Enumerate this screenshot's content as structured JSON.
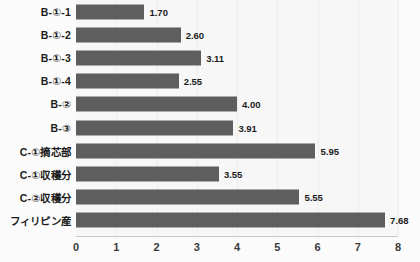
{
  "chart_data": {
    "type": "bar",
    "orientation": "horizontal",
    "title": "",
    "xlabel": "",
    "ylabel": "",
    "xlim": [
      0,
      8
    ],
    "xticks": [
      "0",
      "1",
      "2",
      "3",
      "4",
      "5",
      "6",
      "7",
      "8"
    ],
    "grid": true,
    "legend": "none",
    "bar_color": "#5e5e5e",
    "plot_background": "#f7f7f7",
    "categories": [
      "B-①-1",
      "B-①-2",
      "B-①-3",
      "B-①-4",
      "B-②",
      "B-③",
      "C-①摘芯部",
      "C-①収穫分",
      "C-②収穫分",
      "フィリピン産"
    ],
    "values": [
      1.7,
      2.6,
      3.11,
      2.55,
      4.0,
      3.91,
      5.95,
      3.55,
      5.55,
      7.68
    ],
    "value_labels": [
      "1.70",
      "2.60",
      "3.11",
      "2.55",
      "4.00",
      "3.91",
      "5.95",
      "3.55",
      "5.55",
      "7.68"
    ]
  }
}
